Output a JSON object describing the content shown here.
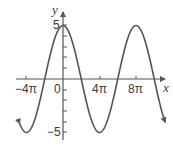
{
  "chart_data": {
    "type": "line",
    "title": "",
    "function": "y = 5cos(x/4)",
    "xlabel": "x",
    "ylabel": "y",
    "x_ticks": [
      "-4π",
      "0",
      "4π",
      "8π"
    ],
    "y_ticks": [
      "5",
      "-5"
    ],
    "xlim": [
      "-5π",
      "11π"
    ],
    "ylim": [
      -5.5,
      5.5
    ],
    "amplitude": 5,
    "period": "8π",
    "grid": false,
    "legend": null,
    "key_points": [
      {
        "x": "-4π",
        "y": -5
      },
      {
        "x": "-2π",
        "y": 0
      },
      {
        "x": "0",
        "y": 5
      },
      {
        "x": "2π",
        "y": 0
      },
      {
        "x": "4π",
        "y": -5
      },
      {
        "x": "6π",
        "y": 0
      },
      {
        "x": "8π",
        "y": 5
      },
      {
        "x": "10π",
        "y": 0
      }
    ],
    "colors": {
      "curve": "#555555",
      "axes": "#555555"
    }
  },
  "labels": {
    "x_axis": "x",
    "y_axis": "y",
    "x_tick_neg4pi": "−4π",
    "x_tick_0": "0",
    "x_tick_4pi": "4π",
    "x_tick_8pi": "8π",
    "y_tick_5": "5",
    "y_tick_neg5": "−5"
  }
}
